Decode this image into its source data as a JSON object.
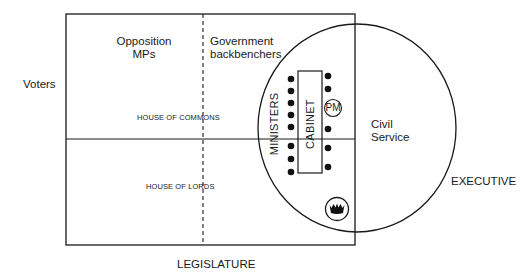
{
  "labels": {
    "voters": "Voters",
    "opposition_mps": [
      "Opposition",
      "MPs"
    ],
    "government_backbenchers": [
      "Government",
      "backbenchers"
    ],
    "house_of_commons": "HOUSE OF COMMONS",
    "house_of_lords": "HOUSE OF LORDS",
    "legislature": "LEGISLATURE",
    "executive": "EXECUTIVE",
    "civil_service": [
      "Civil",
      "Service"
    ],
    "ministers": "MINISTERS",
    "cabinet": "CABINET",
    "pm": "PM"
  },
  "icons": {
    "crown": "crown-icon"
  },
  "colors": {
    "line": "#1a1a1a",
    "background": "#ffffff"
  }
}
